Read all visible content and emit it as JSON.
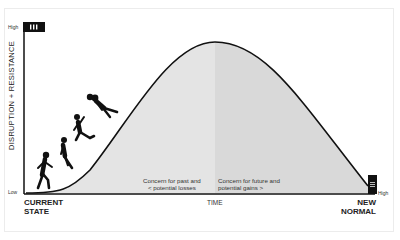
{
  "diagram": {
    "y_axis": {
      "label": "DISRUPTION + RESISTANCE",
      "high_label": "High",
      "low_label": "Low",
      "high_marker": "III"
    },
    "x_axis": {
      "label": "TIME",
      "start_label_line1": "CURRENT",
      "start_label_line2": "STATE",
      "end_label_line1": "NEW",
      "end_label_line2": "NORMAL"
    },
    "right_marker": {
      "label": "High",
      "glyph": "≡"
    },
    "concern_left": {
      "line1": "Concern for past and",
      "line2": "<  potential losses"
    },
    "concern_right": {
      "line1": "Concern for future and",
      "line2": "potential gains  >"
    },
    "colors": {
      "curve": "#111111",
      "fill_left": "#e4e4e4",
      "fill_right": "#dadada",
      "axis": "#111111"
    },
    "figures": [
      "walking-person",
      "leaning-person",
      "stumbling-person",
      "falling-person"
    ]
  }
}
